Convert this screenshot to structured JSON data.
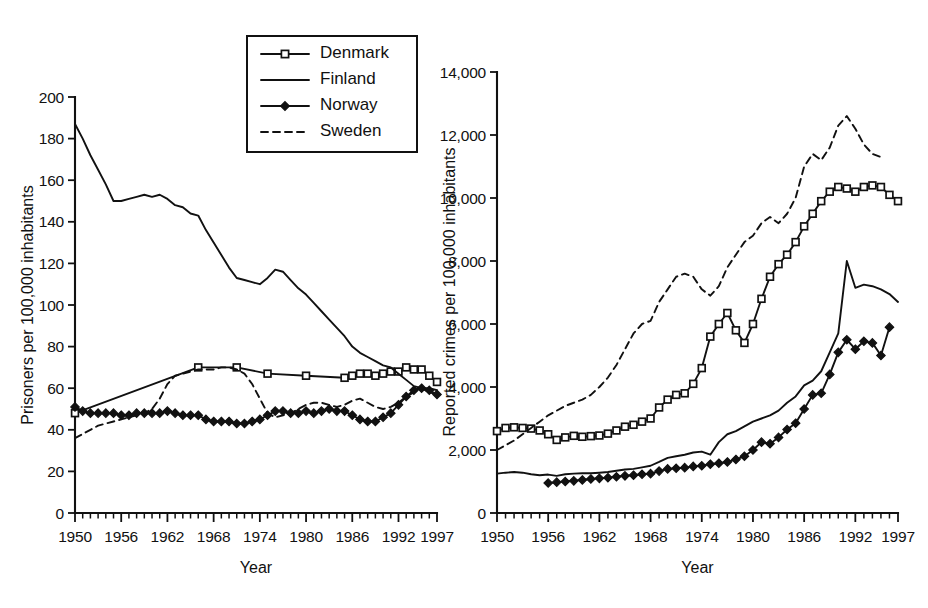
{
  "figure": {
    "caption": "",
    "legend": {
      "items": [
        {
          "label": "Denmark",
          "style": "line-with-open-square-markers"
        },
        {
          "label": "Finland",
          "style": "solid-line"
        },
        {
          "label": "Norway",
          "style": "line-with-filled-diamond-markers"
        },
        {
          "label": "Sweden",
          "style": "dashed-line"
        }
      ]
    }
  },
  "chart_data": [
    {
      "type": "line",
      "id": "prisoners",
      "title": "",
      "xlabel": "Year",
      "ylabel": "Prisoners per 100,000 inhabitants",
      "xlim": [
        1950,
        1997
      ],
      "ylim": [
        0,
        200
      ],
      "yticks": [
        0,
        20,
        40,
        60,
        80,
        100,
        120,
        140,
        160,
        180,
        200
      ],
      "ytick_labels": [
        "0",
        "20",
        "40",
        "60",
        "80",
        "100",
        "120",
        "140",
        "160",
        "180",
        "200"
      ],
      "xticks": [
        1950,
        1956,
        1962,
        1968,
        1974,
        1980,
        1986,
        1992,
        1997
      ],
      "xtick_labels": [
        "1950",
        "1956",
        "1962",
        "1968",
        "1974",
        "1980",
        "1986",
        "1992",
        "1997"
      ],
      "minor_xticks": "every year 1950-1997",
      "grid": false,
      "legend_position": "top-center",
      "series": [
        {
          "name": "Denmark",
          "marker": "open-square",
          "x": [
            1950,
            1966,
            1971,
            1975,
            1980,
            1985,
            1986,
            1987,
            1988,
            1989,
            1990,
            1991,
            1992,
            1993,
            1994,
            1995,
            1996,
            1997
          ],
          "values": [
            48,
            70,
            70,
            67,
            66,
            65,
            66,
            67,
            67,
            66,
            67,
            68,
            68,
            70,
            69,
            69,
            66,
            63
          ]
        },
        {
          "name": "Finland",
          "marker": "none",
          "x": [
            1950,
            1951,
            1952,
            1953,
            1954,
            1955,
            1956,
            1957,
            1958,
            1959,
            1960,
            1961,
            1962,
            1963,
            1964,
            1965,
            1966,
            1967,
            1968,
            1969,
            1970,
            1971,
            1972,
            1973,
            1974,
            1975,
            1976,
            1977,
            1978,
            1979,
            1980,
            1981,
            1982,
            1983,
            1984,
            1985,
            1986,
            1987,
            1988,
            1989,
            1990,
            1991,
            1992,
            1993,
            1994,
            1995,
            1996,
            1997
          ],
          "values": [
            187,
            180,
            172,
            165,
            158,
            150,
            150,
            151,
            152,
            153,
            152,
            153,
            151,
            148,
            147,
            144,
            143,
            136,
            130,
            124,
            118,
            113,
            112,
            111,
            110,
            113,
            117,
            116,
            112,
            108,
            105,
            101,
            97,
            93,
            89,
            85,
            80,
            77,
            75,
            73,
            71,
            70,
            67,
            64,
            61,
            60,
            58,
            57
          ]
        },
        {
          "name": "Norway",
          "marker": "filled-diamond",
          "x": [
            1950,
            1951,
            1952,
            1953,
            1954,
            1955,
            1956,
            1957,
            1958,
            1959,
            1960,
            1961,
            1962,
            1963,
            1964,
            1965,
            1966,
            1967,
            1968,
            1969,
            1970,
            1971,
            1972,
            1973,
            1974,
            1975,
            1976,
            1977,
            1978,
            1979,
            1980,
            1981,
            1982,
            1983,
            1984,
            1985,
            1986,
            1987,
            1988,
            1989,
            1990,
            1991,
            1992,
            1993,
            1994,
            1995,
            1996,
            1997
          ],
          "values": [
            51,
            49,
            48,
            48,
            48,
            48,
            47,
            47,
            48,
            48,
            48,
            48,
            49,
            48,
            47,
            47,
            47,
            45,
            44,
            44,
            44,
            43,
            43,
            44,
            45,
            47,
            49,
            49,
            48,
            48,
            49,
            48,
            49,
            50,
            49,
            49,
            47,
            45,
            44,
            44,
            46,
            48,
            52,
            56,
            59,
            60,
            59,
            57
          ]
        },
        {
          "name": "Sweden",
          "marker": "none",
          "x": [
            1950,
            1951,
            1952,
            1953,
            1954,
            1955,
            1956,
            1957,
            1958,
            1959,
            1960,
            1961,
            1962,
            1963,
            1964,
            1965,
            1966,
            1967,
            1968,
            1969,
            1970,
            1971,
            1972,
            1973,
            1974,
            1975,
            1976,
            1977,
            1978,
            1979,
            1980,
            1981,
            1982,
            1983,
            1984,
            1985,
            1986,
            1987,
            1988,
            1989,
            1990,
            1991,
            1992,
            1993,
            1994,
            1995,
            1996,
            1997
          ],
          "values": [
            36,
            38,
            40,
            42,
            43,
            44,
            45,
            46,
            47,
            48,
            50,
            55,
            62,
            66,
            67,
            68,
            69,
            69,
            69,
            70,
            70,
            69,
            67,
            62,
            55,
            48,
            46,
            47,
            48,
            50,
            52,
            53,
            53,
            52,
            51,
            52,
            54,
            55,
            53,
            51,
            50,
            51,
            53,
            56,
            58,
            60,
            60,
            59
          ]
        }
      ]
    },
    {
      "type": "line",
      "id": "reported-crimes",
      "title": "",
      "xlabel": "Year",
      "ylabel": "Reported crimes per 100,000 inhabitants",
      "xlim": [
        1950,
        1997
      ],
      "ylim": [
        0,
        14000
      ],
      "yticks": [
        0,
        2000,
        4000,
        6000,
        8000,
        10000,
        12000,
        14000
      ],
      "ytick_labels": [
        "0",
        "2,000",
        "4,000",
        "6,000",
        "8,000",
        "10,000",
        "12,000",
        "14,000"
      ],
      "xticks": [
        1950,
        1956,
        1962,
        1968,
        1974,
        1980,
        1986,
        1992,
        1997
      ],
      "xtick_labels": [
        "1950",
        "1956",
        "1962",
        "1968",
        "1974",
        "1980",
        "1986",
        "1992",
        "1997"
      ],
      "minor_xticks": "every year 1950-1997",
      "grid": false,
      "legend_position": "none",
      "series": [
        {
          "name": "Denmark",
          "marker": "open-square",
          "x": [
            1950,
            1951,
            1952,
            1953,
            1954,
            1955,
            1956,
            1957,
            1958,
            1959,
            1960,
            1961,
            1962,
            1963,
            1964,
            1965,
            1966,
            1967,
            1968,
            1969,
            1970,
            1971,
            1972,
            1973,
            1974,
            1975,
            1976,
            1977,
            1978,
            1979,
            1980,
            1981,
            1982,
            1983,
            1984,
            1985,
            1986,
            1987,
            1988,
            1989,
            1990,
            1991,
            1992,
            1993,
            1994,
            1995,
            1996,
            1997
          ],
          "values": [
            2600,
            2700,
            2720,
            2700,
            2680,
            2620,
            2500,
            2320,
            2400,
            2450,
            2420,
            2440,
            2460,
            2520,
            2620,
            2740,
            2800,
            2900,
            3000,
            3350,
            3600,
            3750,
            3800,
            4100,
            4600,
            5600,
            6000,
            6350,
            5800,
            5400,
            6000,
            6800,
            7500,
            7900,
            8200,
            8600,
            9100,
            9500,
            9900,
            10200,
            10350,
            10300,
            10200,
            10350,
            10400,
            10350,
            10100,
            9900
          ]
        },
        {
          "name": "Finland",
          "marker": "none",
          "x": [
            1950,
            1951,
            1952,
            1953,
            1954,
            1955,
            1956,
            1957,
            1958,
            1959,
            1960,
            1961,
            1962,
            1963,
            1964,
            1965,
            1966,
            1967,
            1968,
            1969,
            1970,
            1971,
            1972,
            1973,
            1974,
            1975,
            1976,
            1977,
            1978,
            1979,
            1980,
            1981,
            1982,
            1983,
            1984,
            1985,
            1986,
            1987,
            1988,
            1989,
            1990,
            1991,
            1992,
            1993,
            1994,
            1995,
            1996,
            1997
          ],
          "values": [
            1250,
            1280,
            1300,
            1280,
            1230,
            1200,
            1220,
            1180,
            1230,
            1250,
            1260,
            1260,
            1280,
            1300,
            1340,
            1380,
            1400,
            1450,
            1500,
            1620,
            1750,
            1800,
            1850,
            1920,
            1950,
            1850,
            2250,
            2500,
            2600,
            2750,
            2900,
            3000,
            3100,
            3250,
            3500,
            3700,
            4050,
            4200,
            4500,
            5100,
            5700,
            8000,
            7150,
            7250,
            7200,
            7100,
            6950,
            6700
          ]
        },
        {
          "name": "Norway",
          "marker": "filled-diamond",
          "x": [
            1956,
            1957,
            1958,
            1959,
            1960,
            1961,
            1962,
            1963,
            1964,
            1965,
            1966,
            1967,
            1968,
            1969,
            1970,
            1971,
            1972,
            1973,
            1974,
            1975,
            1976,
            1977,
            1978,
            1979,
            1980,
            1981,
            1982,
            1983,
            1984,
            1985,
            1986,
            1987,
            1988,
            1989,
            1990,
            1991,
            1992,
            1993,
            1994,
            1995,
            1996
          ],
          "values": [
            950,
            980,
            1000,
            1020,
            1050,
            1080,
            1100,
            1120,
            1150,
            1180,
            1200,
            1230,
            1250,
            1330,
            1400,
            1420,
            1440,
            1480,
            1500,
            1550,
            1580,
            1620,
            1700,
            1800,
            2000,
            2250,
            2200,
            2400,
            2650,
            2850,
            3300,
            3750,
            3800,
            4400,
            5100,
            5500,
            5200,
            5450,
            5400,
            5000,
            5900
          ]
        },
        {
          "name": "Sweden",
          "marker": "none",
          "x": [
            1950,
            1951,
            1952,
            1953,
            1954,
            1955,
            1956,
            1957,
            1958,
            1959,
            1960,
            1961,
            1962,
            1963,
            1964,
            1965,
            1966,
            1967,
            1968,
            1969,
            1970,
            1971,
            1972,
            1973,
            1974,
            1975,
            1976,
            1977,
            1978,
            1979,
            1980,
            1981,
            1982,
            1983,
            1984,
            1985,
            1986,
            1987,
            1988,
            1989,
            1990,
            1991,
            1992,
            1993,
            1994,
            1995
          ],
          "values": [
            2000,
            2150,
            2300,
            2500,
            2700,
            2900,
            3100,
            3250,
            3400,
            3500,
            3600,
            3750,
            4000,
            4300,
            4700,
            5200,
            5700,
            6000,
            6100,
            6700,
            7100,
            7500,
            7600,
            7500,
            7100,
            6900,
            7200,
            7800,
            8200,
            8600,
            8800,
            9200,
            9400,
            9200,
            9500,
            10000,
            11000,
            11400,
            11200,
            11600,
            12300,
            12600,
            12200,
            11700,
            11400,
            11300
          ]
        }
      ]
    }
  ]
}
